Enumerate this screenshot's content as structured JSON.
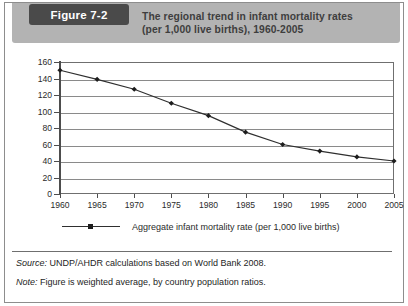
{
  "figure": {
    "label": "Figure 7-2",
    "title_line1": "The regional trend in infant mortality rates",
    "title_line2": "(per 1,000 live births), 1960-2005",
    "band_color": "#b3b3b3",
    "label_box_color": "#4a4a4a",
    "title_color": "#3e3e3e"
  },
  "footnotes": {
    "source_key": "Source:",
    "source_text": " UNDP/AHDR calculations based on World Bank 2008.",
    "note_key": "Note:",
    "note_text": " Figure is weighted average, by country population ratios."
  },
  "chart_data": {
    "type": "line",
    "title": "The regional trend in infant mortality rates (per 1,000 live births), 1960-2005",
    "xlabel": "",
    "ylabel": "",
    "categories": [
      "1960",
      "1965",
      "1970",
      "1975",
      "1980",
      "1985",
      "1990",
      "1995",
      "2000",
      "2005"
    ],
    "x": [
      1960,
      1965,
      1970,
      1975,
      1980,
      1985,
      1990,
      1995,
      2000,
      2005
    ],
    "values": [
      150,
      139,
      127,
      110,
      95,
      75,
      60,
      52,
      45,
      40
    ],
    "series": [
      {
        "name": "Aggregate infant mortality rate (per 1,000 live births)",
        "values": [
          150,
          139,
          127,
          110,
          95,
          75,
          60,
          52,
          45,
          40
        ]
      }
    ],
    "ylim": [
      0,
      160
    ],
    "yticks": [
      0,
      20,
      40,
      60,
      80,
      100,
      120,
      140,
      160
    ],
    "ytick_labels": [
      "0",
      "20",
      "40",
      "60",
      "80",
      "100",
      "120",
      "140",
      "160"
    ],
    "xlim": [
      1960,
      2005
    ],
    "grid": true,
    "grid_axis": "y",
    "legend": [
      "Aggregate infant mortality rate (per 1,000 live births)"
    ],
    "legend_position": "bottom",
    "line_color": "#2f2f2f",
    "marker": "diamond",
    "marker_color": "#1d1d1d"
  }
}
